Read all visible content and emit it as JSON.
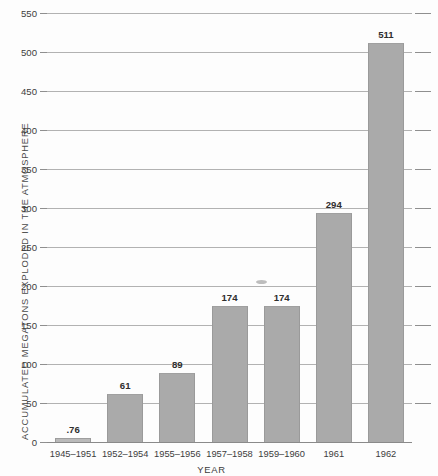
{
  "chart_data": {
    "type": "bar",
    "title": "",
    "xlabel": "YEAR",
    "ylabel": "ACCUMULATED MEGATONS EXPLODED IN THE ATMOSPHERE",
    "categories": [
      "1945–1951",
      "1952–1954",
      "1955–1956",
      "1957–1958",
      "1959–1960",
      "1961",
      "1962"
    ],
    "values": [
      0.76,
      61,
      89,
      174,
      174,
      294,
      511
    ],
    "value_labels": [
      ".76",
      "61",
      "89",
      "174",
      "174",
      "294",
      "511"
    ],
    "ylim": [
      0,
      550
    ],
    "yticks": [
      0,
      50,
      100,
      150,
      200,
      250,
      300,
      350,
      400,
      450,
      500,
      550
    ],
    "ytick_labels": [
      "0",
      "50",
      "100",
      "150",
      "200",
      "250",
      "300",
      "350",
      "400",
      "450",
      "500",
      "550"
    ],
    "grid": true,
    "legend": null,
    "bar_color": "#aaaaaa",
    "gridline_color": "#b2b2b2",
    "axis_color": "#8a8a8a",
    "text_color": "#3c3c3c"
  },
  "artifacts": {
    "smudge_note": "scan-smudge"
  }
}
